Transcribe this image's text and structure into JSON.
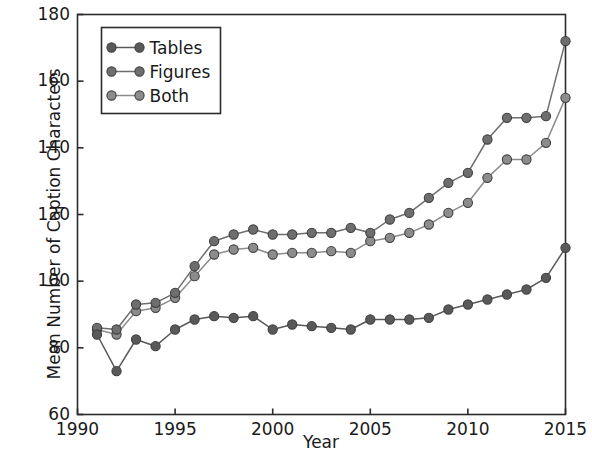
{
  "chart_data": {
    "type": "line",
    "title": "",
    "xlabel": "Year",
    "ylabel": "Mean Number of Caption Characters",
    "xlim": [
      1990,
      2015
    ],
    "ylim": [
      60,
      180
    ],
    "xticks": [
      1990,
      1995,
      2000,
      2005,
      2010,
      2015
    ],
    "yticks": [
      60,
      80,
      100,
      120,
      140,
      160,
      180
    ],
    "grid": false,
    "legend_position": "upper left",
    "x": [
      1991,
      1992,
      1993,
      1994,
      1995,
      1996,
      1997,
      1998,
      1999,
      2000,
      2001,
      2002,
      2003,
      2004,
      2005,
      2006,
      2007,
      2008,
      2009,
      2010,
      2011,
      2012,
      2013,
      2014,
      2015
    ],
    "series": [
      {
        "name": "Tables",
        "color": "#595959",
        "values": [
          84,
          73,
          82.5,
          80.5,
          85.5,
          88.5,
          89.5,
          89,
          89.5,
          85.5,
          87,
          86.5,
          86,
          85.5,
          88.5,
          88.5,
          88.5,
          89,
          91.5,
          93,
          94.5,
          96,
          97.5,
          101,
          110
        ]
      },
      {
        "name": "Figures",
        "color": "#6e6e6e",
        "values": [
          86,
          85.5,
          93,
          93.5,
          96.5,
          104.5,
          112,
          114,
          115.5,
          114,
          114,
          114.5,
          114.5,
          116,
          114.5,
          118.5,
          120.5,
          125,
          129.5,
          132.5,
          142.5,
          149,
          149,
          149.5,
          172
        ]
      },
      {
        "name": "Both",
        "color": "#8c8c8c",
        "values": [
          85.5,
          84,
          91,
          92,
          95,
          101.5,
          108,
          109.5,
          110,
          108,
          108.5,
          108.5,
          109,
          108.5,
          112,
          113,
          114.5,
          117,
          120.5,
          123.5,
          131,
          136.5,
          136.5,
          141.5,
          155
        ]
      }
    ]
  },
  "legend": {
    "items": [
      {
        "label": "Tables"
      },
      {
        "label": "Figures"
      },
      {
        "label": "Both"
      }
    ]
  },
  "axes": {
    "x_title": "Year",
    "y_title": "Mean Number of Caption Characters",
    "x_tick_labels": [
      "1990",
      "1995",
      "2000",
      "2005",
      "2010",
      "2015"
    ],
    "y_tick_labels": [
      "60",
      "80",
      "100",
      "120",
      "140",
      "160",
      "180"
    ]
  },
  "style": {
    "axis_color": "#2b2b2b",
    "text_color": "#1a1a1a",
    "background": "#ffffff",
    "marker_edge": "#3f3f3f"
  }
}
